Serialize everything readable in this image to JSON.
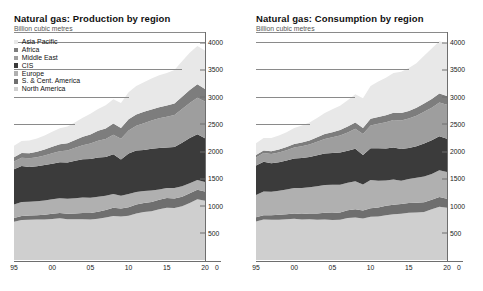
{
  "charts": [
    {
      "title": "Natural gas: Production by region",
      "subtitle": "Billion cubic metres",
      "has_legend": true
    },
    {
      "title": "Natural gas: Consumption by region",
      "subtitle": "Billion cubic metres",
      "has_legend": false
    }
  ],
  "legend": {
    "items": [
      {
        "label": "Asia Pacific",
        "color": "#e8e8e8"
      },
      {
        "label": "Africa",
        "color": "#7d7d7d"
      },
      {
        "label": "Middle East",
        "color": "#9e9e9e"
      },
      {
        "label": "CIS",
        "color": "#3b3b3b"
      },
      {
        "label": "Europe",
        "color": "#b0b0b0"
      },
      {
        "label": "S. & Cent. America",
        "color": "#6f6f6f"
      },
      {
        "label": "North America",
        "color": "#cfcfcf"
      }
    ]
  },
  "axis": {
    "y_ticks": [
      "500",
      "1000",
      "1500",
      "2000",
      "2500",
      "3000",
      "3500",
      "4000"
    ],
    "x_ticks": [
      "95",
      "00",
      "05",
      "10",
      "15",
      "20"
    ],
    "x_zero_label": "0"
  },
  "chart_data": [
    {
      "type": "area",
      "title": "Natural gas: Production by region",
      "subtitle": "Billion cubic metres",
      "xlabel": "",
      "ylabel": "Billion cubic metres",
      "ylim": [
        0,
        4150
      ],
      "xlim": [
        1995,
        2020
      ],
      "grid": true,
      "stacked": true,
      "legend_position": "inside-top-left",
      "x": [
        1995,
        1996,
        1997,
        1998,
        1999,
        2000,
        2001,
        2002,
        2003,
        2004,
        2005,
        2006,
        2007,
        2008,
        2009,
        2010,
        2011,
        2012,
        2013,
        2014,
        2015,
        2016,
        2017,
        2018,
        2019,
        2020
      ],
      "series": [
        {
          "name": "North America",
          "color": "#cfcfcf",
          "values": [
            702,
            735,
            738,
            742,
            745,
            755,
            765,
            750,
            748,
            750,
            742,
            758,
            782,
            810,
            800,
            812,
            855,
            880,
            895,
            930,
            960,
            955,
            985,
            1045,
            1115,
            1090
          ]
        },
        {
          "name": "S. & Cent. America",
          "color": "#6f6f6f",
          "values": [
            70,
            74,
            78,
            82,
            86,
            92,
            96,
            98,
            104,
            112,
            122,
            130,
            138,
            148,
            145,
            156,
            164,
            168,
            172,
            176,
            178,
            176,
            178,
            180,
            176,
            168
          ]
        },
        {
          "name": "Europe",
          "color": "#b0b0b0",
          "values": [
            245,
            258,
            252,
            256,
            262,
            268,
            272,
            276,
            282,
            286,
            280,
            272,
            258,
            256,
            236,
            246,
            230,
            218,
            210,
            190,
            186,
            190,
            192,
            186,
            180,
            176
          ]
        },
        {
          "name": "CIS",
          "color": "#3b3b3b",
          "values": [
            650,
            660,
            640,
            640,
            650,
            654,
            660,
            668,
            688,
            700,
            712,
            724,
            712,
            728,
            664,
            740,
            760,
            756,
            766,
            760,
            740,
            752,
            800,
            830,
            840,
            800
          ]
        },
        {
          "name": "Middle East",
          "color": "#9e9e9e",
          "values": [
            140,
            150,
            160,
            168,
            178,
            192,
            206,
            218,
            238,
            258,
            282,
            306,
            330,
            358,
            382,
            426,
            458,
            490,
            520,
            546,
            566,
            590,
            618,
            644,
            668,
            676
          ]
        },
        {
          "name": "Africa",
          "color": "#7d7d7d",
          "values": [
            82,
            88,
            94,
            100,
            108,
            120,
            128,
            134,
            142,
            156,
            168,
            184,
            196,
            206,
            196,
            206,
            204,
            208,
            202,
            204,
            206,
            212,
            226,
            238,
            246,
            232
          ]
        },
        {
          "name": "Asia Pacific",
          "color": "#e8e8e8",
          "values": [
            208,
            220,
            232,
            244,
            258,
            276,
            292,
            308,
            328,
            352,
            378,
            400,
            424,
            448,
            460,
            494,
            526,
            546,
            566,
            586,
            600,
            612,
            650,
            684,
            706,
            706
          ]
        }
      ]
    },
    {
      "type": "area",
      "title": "Natural gas: Consumption by region",
      "subtitle": "Billion cubic metres",
      "xlabel": "",
      "ylabel": "Billion cubic metres",
      "ylim": [
        0,
        4150
      ],
      "xlim": [
        1995,
        2020
      ],
      "grid": true,
      "stacked": true,
      "legend_position": "none",
      "x": [
        1995,
        1996,
        1997,
        1998,
        1999,
        2000,
        2001,
        2002,
        2003,
        2004,
        2005,
        2006,
        2007,
        2008,
        2009,
        2010,
        2011,
        2012,
        2013,
        2014,
        2015,
        2016,
        2017,
        2018,
        2019,
        2020
      ],
      "series": [
        {
          "name": "North America",
          "color": "#cfcfcf",
          "values": [
            706,
            742,
            738,
            740,
            748,
            756,
            742,
            748,
            740,
            744,
            736,
            738,
            772,
            782,
            760,
            792,
            800,
            822,
            838,
            850,
            866,
            872,
            880,
            930,
            980,
            960
          ]
        },
        {
          "name": "S. & Cent. America",
          "color": "#6f6f6f",
          "values": [
            78,
            82,
            86,
            90,
            94,
            100,
            104,
            108,
            114,
            122,
            128,
            136,
            142,
            152,
            148,
            158,
            166,
            172,
            176,
            180,
            182,
            178,
            180,
            178,
            176,
            166
          ]
        },
        {
          "name": "Europe",
          "color": "#b0b0b0",
          "values": [
            410,
            436,
            430,
            442,
            452,
            468,
            478,
            482,
            502,
            512,
            516,
            510,
            504,
            512,
            478,
            520,
            488,
            468,
            462,
            426,
            438,
            460,
            474,
            470,
            490,
            492
          ]
        },
        {
          "name": "CIS",
          "color": "#3b3b3b",
          "values": [
            540,
            546,
            524,
            524,
            534,
            540,
            548,
            552,
            568,
            578,
            584,
            590,
            588,
            598,
            540,
            580,
            598,
            586,
            592,
            580,
            570,
            578,
            606,
            620,
            628,
            610
          ]
        },
        {
          "name": "Middle East",
          "color": "#9e9e9e",
          "values": [
            148,
            158,
            168,
            178,
            188,
            202,
            216,
            230,
            248,
            268,
            290,
            312,
            336,
            366,
            386,
            422,
            452,
            480,
            504,
            524,
            542,
            562,
            580,
            600,
            618,
            624
          ]
        },
        {
          "name": "Africa",
          "color": "#7d7d7d",
          "values": [
            44,
            48,
            52,
            56,
            60,
            66,
            70,
            74,
            80,
            88,
            94,
            100,
            108,
            114,
            112,
            120,
            122,
            128,
            132,
            138,
            140,
            146,
            152,
            158,
            164,
            158
          ]
        },
        {
          "name": "Asia Pacific",
          "color": "#e8e8e8",
          "values": [
            216,
            230,
            242,
            254,
            270,
            292,
            310,
            330,
            356,
            386,
            418,
            448,
            484,
            520,
            548,
            602,
            652,
            690,
            728,
            758,
            786,
            818,
            878,
            930,
            962,
            972
          ]
        }
      ]
    }
  ]
}
